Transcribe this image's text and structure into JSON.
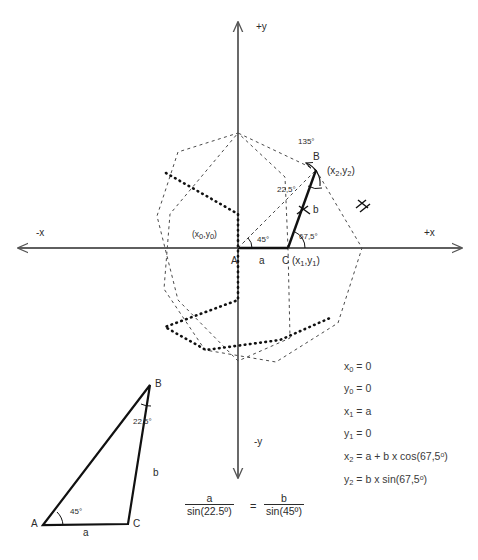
{
  "figure": {
    "type": "geometry-construction-diagram",
    "title_present": false,
    "axes": {
      "x_positive_label": "+x",
      "x_negative_label": "-x",
      "y_positive_label": "+y",
      "y_negative_label": "-y",
      "origin_px": [
        238,
        248
      ],
      "color": "#555555"
    },
    "points": [
      {
        "id": "A",
        "label": "A",
        "coord_label": "(x₀,y₀)",
        "px": [
          238,
          248
        ]
      },
      {
        "id": "C",
        "label": "C",
        "coord_label": "(x₁,y₁)",
        "px": [
          288,
          248
        ]
      },
      {
        "id": "B",
        "label": "B",
        "coord_label": "(x₂,y₂)",
        "px": [
          316,
          170
        ]
      }
    ],
    "segments": [
      {
        "id": "a",
        "label": "a",
        "from": "A",
        "to": "C"
      },
      {
        "id": "b",
        "label": "b",
        "from": "C",
        "to": "B"
      }
    ],
    "angles": [
      {
        "label": "45°",
        "at": "A"
      },
      {
        "label": "67,5°",
        "at": "C"
      },
      {
        "label": "22,5°",
        "at": "B"
      },
      {
        "label": "135°",
        "at": "B-exterior"
      }
    ],
    "octagon": {
      "outer_style": "fine-dashed",
      "inner_style": "bold-dotted",
      "sides": 8
    }
  },
  "equations": [
    "x₀ = 0",
    "y₀ = 0",
    "x₁ = a",
    "y₁ = 0",
    "x₂ = a + b x cos(67,5°)",
    "y₂ = b x sin(67,5°)"
  ],
  "sine_rule": {
    "left_numerator": "a",
    "left_denominator": "sin(22.5º)",
    "equals": "=",
    "right_numerator": "b",
    "right_denominator": "sin(45º)"
  },
  "reference_triangle": {
    "vertex_a_label": "A",
    "vertex_b_label": "B",
    "vertex_c_label": "C",
    "side_a_label": "a",
    "side_b_label": "b",
    "angle_at_a": "45°",
    "angle_at_b": "22,5°"
  },
  "colors": {
    "ink": "#1a1a1a",
    "axis": "#555555",
    "text": "#3a3a3a"
  }
}
